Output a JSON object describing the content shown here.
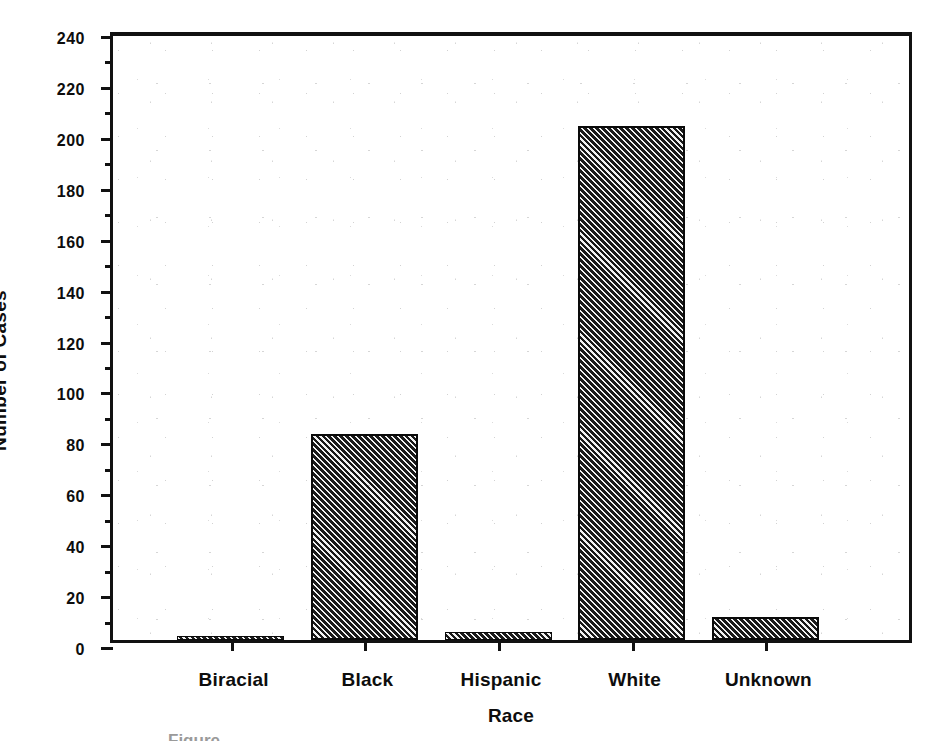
{
  "figure": {
    "background_color": "#ffffff",
    "frame_color": "#111111",
    "bar_fill_color": "#2a2a2a",
    "bar_hatch_color": "#1a1a1a",
    "bar_edge_color": "#0a0a0a"
  },
  "axis_titles": {
    "y": "Number of Cases",
    "x": "Race"
  },
  "y_ticks": [
    {
      "value": 0,
      "label": "0"
    },
    {
      "value": 10,
      "label": ""
    },
    {
      "value": 20,
      "label": "20"
    },
    {
      "value": 30,
      "label": ""
    },
    {
      "value": 40,
      "label": "40"
    },
    {
      "value": 50,
      "label": ""
    },
    {
      "value": 60,
      "label": "60"
    },
    {
      "value": 70,
      "label": ""
    },
    {
      "value": 80,
      "label": "80"
    },
    {
      "value": 90,
      "label": ""
    },
    {
      "value": 100,
      "label": "100"
    },
    {
      "value": 110,
      "label": ""
    },
    {
      "value": 120,
      "label": "120"
    },
    {
      "value": 130,
      "label": ""
    },
    {
      "value": 140,
      "label": "140"
    },
    {
      "value": 150,
      "label": ""
    },
    {
      "value": 160,
      "label": "160"
    },
    {
      "value": 170,
      "label": ""
    },
    {
      "value": 180,
      "label": "180"
    },
    {
      "value": 190,
      "label": ""
    },
    {
      "value": 200,
      "label": "200"
    },
    {
      "value": 210,
      "label": ""
    },
    {
      "value": 220,
      "label": "220"
    },
    {
      "value": 230,
      "label": ""
    },
    {
      "value": 240,
      "label": "240"
    }
  ],
  "caption_cut_off": "Figure",
  "chart_data": {
    "type": "bar",
    "title": "",
    "xlabel": "Race",
    "ylabel": "Number of Cases",
    "categories": [
      "Biracial",
      "Black",
      "Hispanic",
      "White",
      "Unknown"
    ],
    "values": [
      1,
      81,
      3,
      202,
      9
    ],
    "ylim": [
      0,
      240
    ],
    "ytick_step": 20,
    "yminor_tick_step": 10,
    "grid": false,
    "legend": "none",
    "bar_style": "diagonal-hatch"
  }
}
